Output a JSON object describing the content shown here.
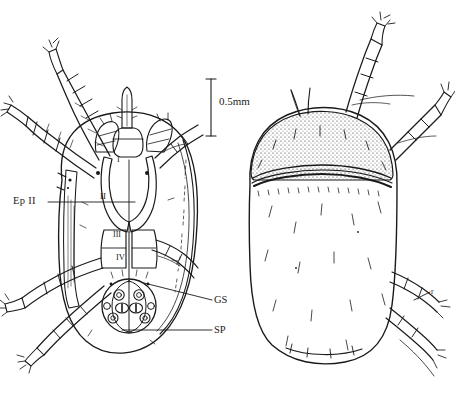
{
  "figure": {
    "kind": "scientific-line-drawing",
    "background_color": "#ffffff",
    "ink_color": "#1a1a1a"
  },
  "scale_bar": {
    "label": "0.5mm",
    "orientation": "vertical",
    "length_px": 57
  },
  "panels": [
    {
      "name": "ventral-view",
      "position": "left"
    },
    {
      "name": "dorsal-view",
      "position": "right"
    }
  ],
  "labels": {
    "epimeral_plate": "Ep II",
    "genital_structure": "GS",
    "spiracular_plate": "SP",
    "rostrum_marker": "r",
    "coxa_1": "I",
    "coxa_2": "II",
    "coxa_3": "III",
    "coxa_4": "IV"
  },
  "caption": {
    "text": "",
    "note": "cropped caption line, glyph tops only, illegible"
  }
}
